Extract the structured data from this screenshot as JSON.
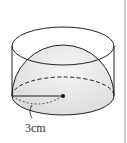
{
  "figure": {
    "radius_label": "3cm",
    "colors": {
      "stroke": "#222222",
      "hemisphere_fill": "#e6e6e6",
      "background": "#ffffff",
      "rule": "#cfcfcf"
    }
  }
}
